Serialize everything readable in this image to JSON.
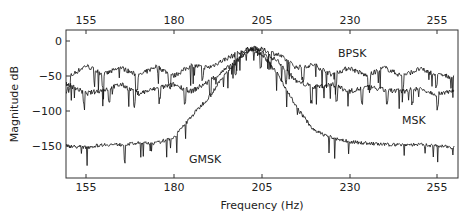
{
  "chart_data": {
    "type": "line",
    "title": "",
    "xlabel": "Frequency (Hz)",
    "ylabel": "Magnitude dB",
    "xlim": [
      149,
      260
    ],
    "ylim": [
      -178,
      16
    ],
    "xticks": [
      155,
      180,
      205,
      230,
      255
    ],
    "yticks": [
      0,
      -50,
      -100,
      -150
    ],
    "grid": false,
    "legend": "inline annotations",
    "annotations": [
      {
        "text": "BPSK",
        "x": 232,
        "y": -28
      },
      {
        "text": "MSK",
        "x": 246,
        "y": -110
      },
      {
        "text": "GMSK",
        "x": 182,
        "y": -158
      }
    ],
    "series": [
      {
        "name": "BPSK",
        "x": [
          150,
          155,
          160,
          165,
          170,
          175,
          180,
          185,
          190,
          195,
          200,
          202,
          205,
          210,
          215,
          220,
          225,
          230,
          235,
          240,
          245,
          250,
          255,
          260
        ],
        "values": [
          -52,
          -35,
          -48,
          -38,
          -50,
          -36,
          -50,
          -35,
          -38,
          -25,
          -14,
          -10,
          -12,
          -20,
          -38,
          -34,
          -48,
          -38,
          -50,
          -38,
          -50,
          -40,
          -48,
          -52
        ]
      },
      {
        "name": "MSK",
        "x": [
          150,
          155,
          160,
          165,
          170,
          175,
          180,
          185,
          190,
          195,
          200,
          202,
          205,
          210,
          215,
          220,
          225,
          230,
          235,
          240,
          245,
          250,
          255,
          260
        ],
        "values": [
          -62,
          -75,
          -70,
          -62,
          -75,
          -68,
          -62,
          -72,
          -58,
          -40,
          -18,
          -12,
          -15,
          -30,
          -58,
          -66,
          -62,
          -72,
          -66,
          -70,
          -72,
          -68,
          -76,
          -70
        ]
      },
      {
        "name": "GMSK",
        "x": [
          150,
          155,
          160,
          165,
          170,
          175,
          180,
          185,
          190,
          195,
          200,
          202,
          205,
          210,
          215,
          220,
          225,
          230,
          235,
          240,
          245,
          250,
          255,
          260
        ],
        "values": [
          -150,
          -152,
          -148,
          -148,
          -146,
          -146,
          -138,
          -108,
          -80,
          -45,
          -18,
          -12,
          -18,
          -50,
          -95,
          -128,
          -138,
          -144,
          -146,
          -148,
          -148,
          -148,
          -150,
          -152
        ]
      }
    ]
  },
  "axes": {
    "top_ticks": [
      "155",
      "180",
      "205",
      "230",
      "255"
    ],
    "bottom_ticks": [
      "155",
      "180",
      "205",
      "230",
      "255"
    ],
    "left_ticks": [
      "0",
      "−50",
      "−100",
      "−150"
    ],
    "xlabel": "Frequency (Hz)",
    "ylabel": "Magnitude dB"
  },
  "labels": {
    "bpsk": "BPSK",
    "msk": "MSK",
    "gmsk": "GMSK"
  }
}
